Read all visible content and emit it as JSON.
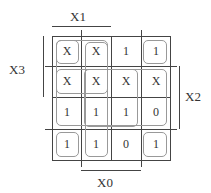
{
  "labels": {
    "top": "X1",
    "left": "X3",
    "right": "X2",
    "bottom": "X0"
  },
  "kmap": {
    "rows": [
      [
        "X",
        "X",
        "1",
        "1"
      ],
      [
        "X",
        "X",
        "X",
        "X"
      ],
      [
        "1",
        "1",
        "1",
        "0"
      ],
      [
        "1",
        "1",
        "0",
        "1"
      ]
    ]
  }
}
